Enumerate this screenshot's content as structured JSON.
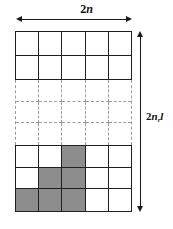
{
  "figure": {
    "background_color": "#ffffff",
    "line_color": "#231f20",
    "dashed_color": "#9a9a9a",
    "shade_color": "#8d8d8d"
  },
  "width_label": {
    "number": "2",
    "symbol": "n",
    "full_text": "2n"
  },
  "height_label": {
    "number": "2",
    "symbol": "n",
    "subscript": "r",
    "trailing": "l",
    "full_text": "2n_r l"
  },
  "grid": {
    "columns": 5,
    "top_block": {
      "style": "solid",
      "rows": 2,
      "cells": [
        [
          "white",
          "white",
          "white",
          "white",
          "white"
        ],
        [
          "white",
          "white",
          "white",
          "white",
          "white"
        ]
      ]
    },
    "middle_block": {
      "style": "dashed",
      "rows": 3,
      "cells": [
        [
          "white",
          "white",
          "white",
          "white",
          "white"
        ],
        [
          "white",
          "white",
          "white",
          "white",
          "white"
        ],
        [
          "white",
          "white",
          "white",
          "white",
          "white"
        ]
      ]
    },
    "bottom_block": {
      "style": "solid",
      "rows": 3,
      "cells": [
        [
          "white",
          "white",
          "shaded",
          "white",
          "white"
        ],
        [
          "white",
          "shaded",
          "shaded",
          "white",
          "white"
        ],
        [
          "shaded",
          "shaded",
          "shaded",
          "white",
          "white"
        ]
      ]
    }
  }
}
